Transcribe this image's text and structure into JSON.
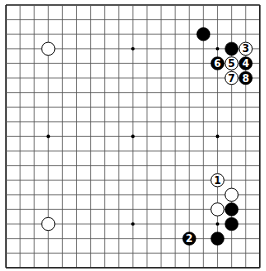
{
  "board": {
    "size": 19,
    "origin_x": 6,
    "origin_y": 5,
    "spacing_x": 14.1,
    "spacing_y": 14.6,
    "line_color": "#555555",
    "edge_color": "#222222",
    "background": "#ffffff",
    "star_points": [
      [
        3,
        3
      ],
      [
        9,
        3
      ],
      [
        15,
        3
      ],
      [
        3,
        9
      ],
      [
        9,
        9
      ],
      [
        15,
        9
      ],
      [
        3,
        15
      ],
      [
        9,
        15
      ],
      [
        15,
        15
      ]
    ]
  },
  "colors": {
    "black_stone": "#000000",
    "white_stone": "#ffffff",
    "stone_outline": "#000000",
    "label_on_black": "#ffffff",
    "label_on_white": "#000000"
  },
  "stones": [
    {
      "color": "white",
      "col": 3,
      "row": 3,
      "label": ""
    },
    {
      "color": "white",
      "col": 3,
      "row": 15,
      "label": ""
    },
    {
      "color": "black",
      "col": 14,
      "row": 2,
      "label": ""
    },
    {
      "color": "black",
      "col": 16,
      "row": 3,
      "label": ""
    },
    {
      "color": "white",
      "col": 17,
      "row": 3,
      "label": "3"
    },
    {
      "color": "black",
      "col": 15,
      "row": 4,
      "label": "6"
    },
    {
      "color": "white",
      "col": 16,
      "row": 4,
      "label": "5"
    },
    {
      "color": "black",
      "col": 17,
      "row": 4,
      "label": "4"
    },
    {
      "color": "white",
      "col": 16,
      "row": 5,
      "label": "7"
    },
    {
      "color": "black",
      "col": 17,
      "row": 5,
      "label": "8"
    },
    {
      "color": "white",
      "col": 15,
      "row": 12,
      "label": "1"
    },
    {
      "color": "white",
      "col": 16,
      "row": 13,
      "label": ""
    },
    {
      "color": "white",
      "col": 15,
      "row": 14,
      "label": ""
    },
    {
      "color": "black",
      "col": 16,
      "row": 14,
      "label": ""
    },
    {
      "color": "black",
      "col": 16,
      "row": 15,
      "label": ""
    },
    {
      "color": "black",
      "col": 15,
      "row": 16,
      "label": ""
    },
    {
      "color": "black",
      "col": 13,
      "row": 16,
      "label": "2"
    }
  ]
}
